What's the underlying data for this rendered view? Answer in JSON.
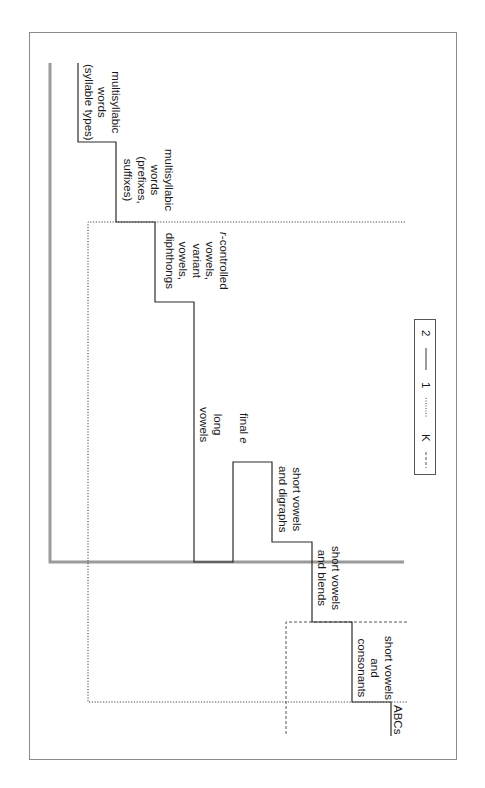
{
  "diagram": {
    "type": "staircase-progression",
    "orientation": "rotated-90",
    "steps": [
      {
        "id": "abcs",
        "lines": [
          "ABCs"
        ]
      },
      {
        "id": "short-vowels-consonants",
        "lines": [
          "short vowels",
          "and",
          "consonants"
        ]
      },
      {
        "id": "short-vowels-blends",
        "lines": [
          "short vowels",
          "and blends"
        ]
      },
      {
        "id": "short-vowels-digraphs",
        "lines": [
          "short vowels",
          "and digraphs"
        ]
      },
      {
        "id": "final-e",
        "lines": [
          "final "
        ],
        "italic_suffix": "e"
      },
      {
        "id": "long-vowels",
        "lines": [
          "long",
          "vowels"
        ]
      },
      {
        "id": "r-controlled",
        "italic_prefix": "r",
        "lines": [
          "-controlled",
          "vowels,",
          "variant",
          "vowels,",
          "diphthongs"
        ]
      },
      {
        "id": "multisyllabic-prefixes",
        "lines": [
          "multisyllabic",
          "words",
          "(prefixes,",
          "suffixes)"
        ]
      },
      {
        "id": "multisyllabic-syllable-types",
        "lines": [
          "multisyllabic",
          "words",
          "(syllable types)"
        ]
      }
    ],
    "legend": {
      "items": [
        {
          "style": "dashed",
          "label": "K"
        },
        {
          "style": "dotted",
          "label": "1"
        },
        {
          "style": "solid",
          "label": "2"
        }
      ]
    },
    "colors": {
      "step_line": "#2b2b2b",
      "grade2_line": "#9a9a9a",
      "grade1_line": "#444444",
      "k_line": "#555555",
      "frame": "#8a8a8a"
    }
  }
}
